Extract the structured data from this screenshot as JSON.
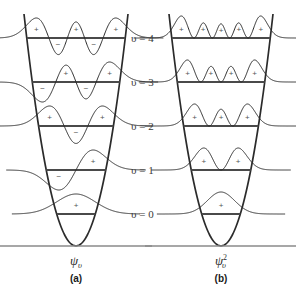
{
  "figure": {
    "title_absent": true,
    "background_color": "#ffffff",
    "stroke_color": "#2b2b2b",
    "level_line_color": "#4a4a4a",
    "baseline_color": "#8a8a8a",
    "sign_color": "#555555",
    "label_color": "#3a3a3a"
  },
  "levels": [
    {
      "id": "v4",
      "label": "υ = 4",
      "n": 4,
      "y": 38
    },
    {
      "id": "v3",
      "label": "υ = 3",
      "n": 3,
      "y": 82
    },
    {
      "id": "v2",
      "label": "υ = 2",
      "n": 2,
      "y": 126
    },
    {
      "id": "v1",
      "label": "υ = 1",
      "n": 1,
      "y": 170
    },
    {
      "id": "v0",
      "label": "υ = 0",
      "n": 0,
      "y": 214
    }
  ],
  "panels": [
    {
      "id": "a",
      "letter": "(a)",
      "caption_main": "ψ",
      "caption_sub": "υ",
      "caption_sup": "",
      "quantity": "wavefunction",
      "center_x": 76,
      "signs": {
        "v4": [
          "+",
          "-",
          "+",
          "-",
          "+"
        ],
        "v3": [
          "-",
          "+",
          "-",
          "+"
        ],
        "v2": [
          "+",
          "-",
          "+"
        ],
        "v1": [
          "-",
          "+"
        ],
        "v0": [
          "+"
        ]
      }
    },
    {
      "id": "b",
      "letter": "(b)",
      "caption_main": "ψ",
      "caption_sub": "υ",
      "caption_sup": "2",
      "quantity": "probability-density",
      "center_x": 221,
      "signs": {
        "v4": [
          "+",
          "+",
          "+",
          "+",
          "+"
        ],
        "v3": [
          "+",
          "+",
          "+",
          "+"
        ],
        "v2": [
          "+",
          "+",
          "+"
        ],
        "v1": [
          "+",
          "+"
        ],
        "v0": [
          "+"
        ]
      }
    }
  ],
  "baseline": {
    "y": 246,
    "label": ""
  },
  "chart_data": {
    "type": "line",
    "xlabel": "",
    "ylabel": "",
    "categories": [
      "υ = 0",
      "υ = 1",
      "υ = 2",
      "υ = 3",
      "υ = 4"
    ],
    "series": [
      {
        "name": "ψᵥ nodes",
        "values": [
          0,
          1,
          2,
          3,
          4
        ]
      },
      {
        "name": "ψᵥ lobes",
        "values": [
          1,
          2,
          3,
          4,
          5
        ]
      },
      {
        "name": "ψᵥ² peaks",
        "values": [
          1,
          2,
          3,
          4,
          5
        ]
      },
      {
        "name": "level y (px)",
        "values": [
          214,
          170,
          126,
          82,
          38
        ]
      }
    ],
    "legend_position": "right",
    "grid": false
  }
}
